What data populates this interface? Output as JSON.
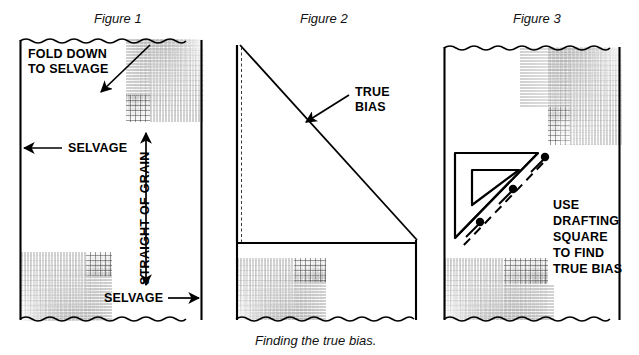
{
  "caption": "Finding the true bias.",
  "panels": [
    {
      "id": "figure-1",
      "title": "Figure 1",
      "labels": {
        "fold_down": "FOLD DOWN\nTO SELVAGE",
        "selvage_left": "SELVAGE",
        "selvage_bottom": "SELVAGE",
        "straight_of_grain": "STRAIGHT OF GRAIN"
      }
    },
    {
      "id": "figure-2",
      "title": "Figure 2",
      "labels": {
        "true_bias": "TRUE\nBIAS"
      }
    },
    {
      "id": "figure-3",
      "title": "Figure 3",
      "labels": {
        "instruction": "USE\nDRAFTING\nSQUARE\nTO FIND\nTRUE BIAS"
      }
    }
  ],
  "colors": {
    "ink": "#000000",
    "paper": "#ffffff",
    "label_ink": "#111111"
  },
  "icons": {
    "fold_arrow": "arrow-diagonal-down-left-icon",
    "selvage_left_arrow": "arrow-left-icon",
    "selvage_bottom_arrow": "arrow-right-icon",
    "grain_arrow": "arrow-double-vertical-icon",
    "bias_arrow": "arrow-diagonal-down-left-icon",
    "drafting_square": "triangle-drafting-square-icon",
    "pins": "pin-icon"
  }
}
